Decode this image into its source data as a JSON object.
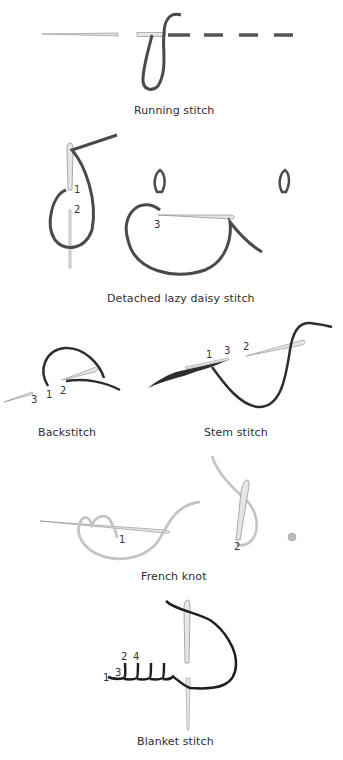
{
  "diagrams": [
    {
      "id": "running",
      "caption": "Running stitch",
      "numbers": []
    },
    {
      "id": "lazy-daisy",
      "caption": "Detached lazy daisy stitch",
      "numbers": [
        "1",
        "2",
        "3"
      ]
    },
    {
      "id": "backstitch",
      "caption": "Backstitch",
      "numbers": [
        "3",
        "1",
        "2"
      ]
    },
    {
      "id": "stem",
      "caption": "Stem stitch",
      "numbers": [
        "1",
        "3",
        "2"
      ]
    },
    {
      "id": "french-knot",
      "caption": "French knot",
      "numbers": [
        "1",
        "2"
      ]
    },
    {
      "id": "blanket",
      "caption": "Blanket stitch",
      "numbers": [
        "1",
        "3",
        "2",
        "4"
      ]
    }
  ],
  "colors": {
    "thread_dark": "#4a4a4a",
    "thread_black": "#1e1e1e",
    "thread_light": "#c8c8c8",
    "needle_fill": "#e6e6e6",
    "needle_stroke": "#8a8a8a",
    "text": "#2e2e2e"
  }
}
